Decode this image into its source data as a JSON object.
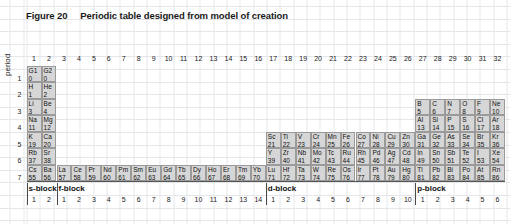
{
  "figure": {
    "label": "Figure 20",
    "caption": "Periodic table designed from model of creation"
  },
  "axis": {
    "period_label": "period"
  },
  "columns": [
    "1",
    "2",
    "3",
    "4",
    "5",
    "6",
    "7",
    "8",
    "9",
    "10",
    "11",
    "12",
    "13",
    "14",
    "15",
    "16",
    "17",
    "18",
    "19",
    "20",
    "21",
    "22",
    "23",
    "24",
    "25",
    "26",
    "27",
    "28",
    "29",
    "30",
    "31",
    "32"
  ],
  "periods": [
    "1",
    "2",
    "3",
    "4",
    "5",
    "6",
    "7"
  ],
  "blocks": [
    {
      "name": "s-block",
      "start_col": 1,
      "numbers": [
        "1",
        "2"
      ]
    },
    {
      "name": "f-block",
      "start_col": 3,
      "numbers": [
        "1",
        "2",
        "3",
        "4",
        "5",
        "6",
        "7",
        "8",
        "9",
        "10",
        "11",
        "12",
        "13",
        "14"
      ]
    },
    {
      "name": "d-block",
      "start_col": 17,
      "numbers": [
        "1",
        "2",
        "3",
        "4",
        "5",
        "6",
        "7",
        "8",
        "9",
        "10"
      ]
    },
    {
      "name": "p-block",
      "start_col": 27,
      "numbers": [
        "1",
        "2",
        "3",
        "4",
        "5",
        "6"
      ]
    }
  ],
  "elements": [
    {
      "period": 1,
      "col": 1,
      "symbol": "G1",
      "z": "0"
    },
    {
      "period": 1,
      "col": 2,
      "symbol": "G2",
      "z": "0"
    },
    {
      "period": 2,
      "col": 1,
      "symbol": "H",
      "z": "1"
    },
    {
      "period": 2,
      "col": 2,
      "symbol": "He",
      "z": "2"
    },
    {
      "period": 3,
      "col": 1,
      "symbol": "Li",
      "z": "3"
    },
    {
      "period": 3,
      "col": 2,
      "symbol": "Be",
      "z": "4"
    },
    {
      "period": 3,
      "col": 27,
      "symbol": "B",
      "z": "5"
    },
    {
      "period": 3,
      "col": 28,
      "symbol": "C",
      "z": "6"
    },
    {
      "period": 3,
      "col": 29,
      "symbol": "N",
      "z": "7"
    },
    {
      "period": 3,
      "col": 30,
      "symbol": "O",
      "z": "8"
    },
    {
      "period": 3,
      "col": 31,
      "symbol": "F",
      "z": "9"
    },
    {
      "period": 3,
      "col": 32,
      "symbol": "Ne",
      "z": "10"
    },
    {
      "period": 4,
      "col": 1,
      "symbol": "Na",
      "z": "11"
    },
    {
      "period": 4,
      "col": 2,
      "symbol": "Mg",
      "z": "12"
    },
    {
      "period": 4,
      "col": 27,
      "symbol": "Al",
      "z": "13"
    },
    {
      "period": 4,
      "col": 28,
      "symbol": "Si",
      "z": "14"
    },
    {
      "period": 4,
      "col": 29,
      "symbol": "P",
      "z": "15"
    },
    {
      "period": 4,
      "col": 30,
      "symbol": "S",
      "z": "16"
    },
    {
      "period": 4,
      "col": 31,
      "symbol": "Cl",
      "z": "17"
    },
    {
      "period": 4,
      "col": 32,
      "symbol": "Ar",
      "z": "18"
    },
    {
      "period": 5,
      "col": 1,
      "symbol": "K",
      "z": "19"
    },
    {
      "period": 5,
      "col": 2,
      "symbol": "Ca",
      "z": "20"
    },
    {
      "period": 5,
      "col": 17,
      "symbol": "Sc",
      "z": "21"
    },
    {
      "period": 5,
      "col": 18,
      "symbol": "Ti",
      "z": "22"
    },
    {
      "period": 5,
      "col": 19,
      "symbol": "V",
      "z": "23"
    },
    {
      "period": 5,
      "col": 20,
      "symbol": "Cr",
      "z": "24"
    },
    {
      "period": 5,
      "col": 21,
      "symbol": "Mn",
      "z": "25"
    },
    {
      "period": 5,
      "col": 22,
      "symbol": "Fe",
      "z": "26"
    },
    {
      "period": 5,
      "col": 23,
      "symbol": "Co",
      "z": "27"
    },
    {
      "period": 5,
      "col": 24,
      "symbol": "Ni",
      "z": "28"
    },
    {
      "period": 5,
      "col": 25,
      "symbol": "Cu",
      "z": "29"
    },
    {
      "period": 5,
      "col": 26,
      "symbol": "Zn",
      "z": "30"
    },
    {
      "period": 5,
      "col": 27,
      "symbol": "Ga",
      "z": "31"
    },
    {
      "period": 5,
      "col": 28,
      "symbol": "Ge",
      "z": "32"
    },
    {
      "period": 5,
      "col": 29,
      "symbol": "As",
      "z": "33"
    },
    {
      "period": 5,
      "col": 30,
      "symbol": "Se",
      "z": "34"
    },
    {
      "period": 5,
      "col": 31,
      "symbol": "Br",
      "z": "35"
    },
    {
      "period": 5,
      "col": 32,
      "symbol": "Kr",
      "z": "36"
    },
    {
      "period": 6,
      "col": 1,
      "symbol": "Rb",
      "z": "37"
    },
    {
      "period": 6,
      "col": 2,
      "symbol": "Sr",
      "z": "38"
    },
    {
      "period": 6,
      "col": 17,
      "symbol": "Y",
      "z": "39"
    },
    {
      "period": 6,
      "col": 18,
      "symbol": "Zr",
      "z": "40"
    },
    {
      "period": 6,
      "col": 19,
      "symbol": "Nb",
      "z": "41"
    },
    {
      "period": 6,
      "col": 20,
      "symbol": "Mo",
      "z": "42"
    },
    {
      "period": 6,
      "col": 21,
      "symbol": "Tc",
      "z": "43"
    },
    {
      "period": 6,
      "col": 22,
      "symbol": "Ru",
      "z": "44"
    },
    {
      "period": 6,
      "col": 23,
      "symbol": "Rh",
      "z": "45"
    },
    {
      "period": 6,
      "col": 24,
      "symbol": "Pd",
      "z": "46"
    },
    {
      "period": 6,
      "col": 25,
      "symbol": "Ag",
      "z": "47"
    },
    {
      "period": 6,
      "col": 26,
      "symbol": "Cd",
      "z": "48"
    },
    {
      "period": 6,
      "col": 27,
      "symbol": "In",
      "z": "49"
    },
    {
      "period": 6,
      "col": 28,
      "symbol": "Sn",
      "z": "50"
    },
    {
      "period": 6,
      "col": 29,
      "symbol": "Sb",
      "z": "51"
    },
    {
      "period": 6,
      "col": 30,
      "symbol": "Te",
      "z": "52"
    },
    {
      "period": 6,
      "col": 31,
      "symbol": "I",
      "z": "53"
    },
    {
      "period": 6,
      "col": 32,
      "symbol": "Xe",
      "z": "54"
    },
    {
      "period": 7,
      "col": 1,
      "symbol": "Cs",
      "z": "55"
    },
    {
      "period": 7,
      "col": 2,
      "symbol": "Ba",
      "z": "56"
    },
    {
      "period": 7,
      "col": 3,
      "symbol": "La",
      "z": "57"
    },
    {
      "period": 7,
      "col": 4,
      "symbol": "Ce",
      "z": "58"
    },
    {
      "period": 7,
      "col": 5,
      "symbol": "Pr",
      "z": "59"
    },
    {
      "period": 7,
      "col": 6,
      "symbol": "Nd",
      "z": "60"
    },
    {
      "period": 7,
      "col": 7,
      "symbol": "Pm",
      "z": "61"
    },
    {
      "period": 7,
      "col": 8,
      "symbol": "Sm",
      "z": "62"
    },
    {
      "period": 7,
      "col": 9,
      "symbol": "Eu",
      "z": "63"
    },
    {
      "period": 7,
      "col": 10,
      "symbol": "Gd",
      "z": "64"
    },
    {
      "period": 7,
      "col": 11,
      "symbol": "Tb",
      "z": "65"
    },
    {
      "period": 7,
      "col": 12,
      "symbol": "Dy",
      "z": "66"
    },
    {
      "period": 7,
      "col": 13,
      "symbol": "Ho",
      "z": "67"
    },
    {
      "period": 7,
      "col": 14,
      "symbol": "Er",
      "z": "68"
    },
    {
      "period": 7,
      "col": 15,
      "symbol": "Tm",
      "z": "69"
    },
    {
      "period": 7,
      "col": 16,
      "symbol": "Yb",
      "z": "70"
    },
    {
      "period": 7,
      "col": 17,
      "symbol": "Lu",
      "z": "71"
    },
    {
      "period": 7,
      "col": 18,
      "symbol": "Hf",
      "z": "72"
    },
    {
      "period": 7,
      "col": 19,
      "symbol": "Ta",
      "z": "73"
    },
    {
      "period": 7,
      "col": 20,
      "symbol": "W",
      "z": "74"
    },
    {
      "period": 7,
      "col": 21,
      "symbol": "Re",
      "z": "75"
    },
    {
      "period": 7,
      "col": 22,
      "symbol": "Os",
      "z": "76"
    },
    {
      "period": 7,
      "col": 23,
      "symbol": "Ir",
      "z": "77"
    },
    {
      "period": 7,
      "col": 24,
      "symbol": "Pt",
      "z": "78"
    },
    {
      "period": 7,
      "col": 25,
      "symbol": "Au",
      "z": "79"
    },
    {
      "period": 7,
      "col": 26,
      "symbol": "Hg",
      "z": "80"
    },
    {
      "period": 7,
      "col": 27,
      "symbol": "Tl",
      "z": "81"
    },
    {
      "period": 7,
      "col": 28,
      "symbol": "Pb",
      "z": "82"
    },
    {
      "period": 7,
      "col": 29,
      "symbol": "Bi",
      "z": "83"
    },
    {
      "period": 7,
      "col": 30,
      "symbol": "Po",
      "z": "84"
    },
    {
      "period": 7,
      "col": 31,
      "symbol": "At",
      "z": "85"
    },
    {
      "period": 7,
      "col": 32,
      "symbol": "Rn",
      "z": "86"
    }
  ],
  "colors": {
    "cell_fill": "#d6d6d6",
    "cell_border": "#9a9a9a",
    "gridline": "#e4e6e9"
  }
}
